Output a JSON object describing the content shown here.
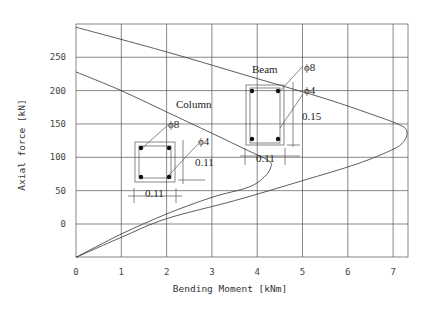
{
  "chart_data": {
    "type": "line",
    "title": "",
    "xlabel": "Bending Moment [kNm]",
    "ylabel": "Axial force [kN]",
    "xlim": [
      0,
      7.3
    ],
    "ylim": [
      -50,
      300
    ],
    "grid": true,
    "x_ticks": [
      "0",
      "1",
      "2",
      "3",
      "4",
      "5",
      "6",
      "7"
    ],
    "y_ticks": [
      "0",
      "50",
      "100",
      "150",
      "200",
      "250"
    ],
    "series": [
      {
        "name": "Beam",
        "points": [
          [
            0,
            295
          ],
          [
            2,
            258
          ],
          [
            4,
            218
          ],
          [
            5.5,
            188
          ],
          [
            6.5,
            165
          ],
          [
            7.1,
            150
          ],
          [
            7.3,
            140
          ],
          [
            7.25,
            125
          ],
          [
            7.0,
            112
          ],
          [
            6.2,
            90
          ],
          [
            5,
            65
          ],
          [
            3.5,
            35
          ],
          [
            2,
            8
          ],
          [
            1,
            -20
          ],
          [
            0,
            -50
          ]
        ]
      },
      {
        "name": "Column",
        "points": [
          [
            0,
            228
          ],
          [
            1,
            200
          ],
          [
            2,
            168
          ],
          [
            3,
            136
          ],
          [
            3.8,
            110
          ],
          [
            4.25,
            95
          ],
          [
            4.3,
            85
          ],
          [
            4.15,
            70
          ],
          [
            3.8,
            55
          ],
          [
            3,
            40
          ],
          [
            2,
            15
          ],
          [
            1,
            -15
          ],
          [
            0,
            -50
          ]
        ]
      }
    ],
    "annotations": {
      "column_label": "Column",
      "beam_label": "Beam",
      "column_bar_large": "ϕ8",
      "column_bar_small": "ϕ4",
      "column_height": "0.11",
      "column_width": "0.11",
      "beam_bar_large": "ϕ8",
      "beam_bar_small": "ϕ4",
      "beam_height": "0.15",
      "beam_width": "0.11"
    }
  }
}
